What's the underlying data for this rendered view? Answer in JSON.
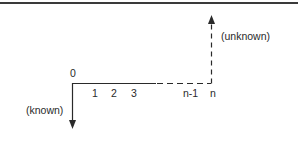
{
  "diagram": {
    "type": "cash-flow-diagram",
    "origin_label": "0",
    "period_labels": [
      "1",
      "2",
      "3",
      "n-1",
      "n"
    ],
    "known_label": "(known)",
    "unknown_label": "(unknown)",
    "colors": {
      "line": "#2a2a2a",
      "text": "#2a2a2a",
      "rule": "#3a3a3a"
    }
  }
}
